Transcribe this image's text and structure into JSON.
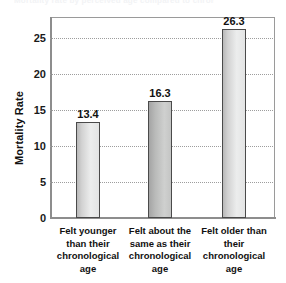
{
  "title_remnant": "Mortality rate by perceived age compared to chronological age",
  "chart_data": {
    "type": "bar",
    "title": "",
    "xlabel": "",
    "ylabel": "Mortality Rate",
    "ylim": [
      0,
      28
    ],
    "yticks": [
      0,
      5,
      10,
      15,
      20,
      25
    ],
    "ytick_labels": [
      "0",
      "5",
      "10",
      "15",
      "20",
      "25"
    ],
    "grid": true,
    "legend": false,
    "categories": [
      "Felt younger than their chronological age",
      "Felt about the same as their chronological age",
      "Felt older than their chronological age"
    ],
    "category_lines": [
      [
        "Felt younger",
        "than their",
        "chronological",
        "age"
      ],
      [
        "Felt about the",
        "same as their",
        "chronological",
        "age"
      ],
      [
        "Felt older than",
        "their",
        "chronological",
        "age"
      ]
    ],
    "values": [
      13.4,
      16.3,
      26.3
    ],
    "value_labels": [
      "13.4",
      "16.3",
      "26.3"
    ],
    "bar_colors": [
      "#e3e4e4",
      "#c4c5c4",
      "#e3e4e4"
    ],
    "bar_outline_color": "#4a4a4a"
  }
}
